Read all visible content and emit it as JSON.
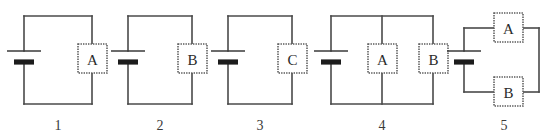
{
  "figure": {
    "kind": "circuit-diagram-set",
    "background_color": "#ffffff",
    "wire_color": "#4a4a4a",
    "box_color": "#ffffff",
    "text_color": "#2b2b2b",
    "circuit_count": 5
  },
  "circuits": [
    {
      "number_label": "1",
      "components": [
        {
          "letter": "A",
          "position": "right-branch"
        }
      ],
      "source": "battery",
      "topology": "single-loop",
      "description": "Battery on left, component A in series on right side of loop"
    },
    {
      "number_label": "2",
      "components": [
        {
          "letter": "B",
          "position": "right-branch"
        }
      ],
      "source": "battery",
      "topology": "single-loop",
      "description": "Battery on left, component B in series on right side of loop"
    },
    {
      "number_label": "3",
      "components": [
        {
          "letter": "C",
          "position": "right-branch"
        }
      ],
      "source": "battery",
      "topology": "single-loop",
      "description": "Battery on left, component C in series on right side of loop"
    },
    {
      "number_label": "4",
      "components": [
        {
          "letter": "A",
          "position": "middle-branch"
        },
        {
          "letter": "B",
          "position": "right-branch"
        }
      ],
      "source": "battery",
      "topology": "parallel-vertical",
      "description": "Battery on left, components A and B on parallel vertical branches"
    },
    {
      "number_label": "5",
      "components": [
        {
          "letter": "A",
          "position": "top-branch"
        },
        {
          "letter": "B",
          "position": "bottom-branch"
        }
      ],
      "source": "battery",
      "topology": "parallel-horizontal",
      "description": "Battery on left, components A and B on parallel horizontal branches"
    }
  ],
  "labels": {
    "number_1": "1",
    "number_2": "2",
    "number_3": "3",
    "number_4": "4",
    "number_5": "5",
    "box_1_a": "A",
    "box_2_b": "B",
    "box_3_c": "C",
    "box_4_a": "A",
    "box_4_b": "B",
    "box_5_a": "A",
    "box_5_b": "B"
  }
}
